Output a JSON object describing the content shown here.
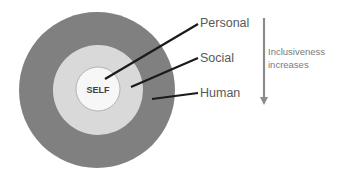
{
  "diagram": {
    "type": "concentric-circles",
    "rings": [
      {
        "name": "self",
        "label": "SELF",
        "color": "#f7f7f7",
        "stroke": "#a6a6a6",
        "radius": 22
      },
      {
        "name": "social",
        "label": "Social",
        "color": "#d9d9d9",
        "radius": 45
      },
      {
        "name": "human",
        "label": "Human",
        "color": "#808080",
        "radius": 78
      }
    ],
    "pointers": [
      {
        "label": "Personal"
      },
      {
        "label": "Social"
      },
      {
        "label": "Human"
      }
    ],
    "arrow": {
      "direction": "down",
      "color": "#8c8c8c",
      "text_line1": "Inclusiveness",
      "text_line2": "increases"
    }
  }
}
